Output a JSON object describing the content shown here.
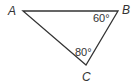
{
  "diagram": {
    "type": "triangle",
    "vertices": [
      {
        "label": "A",
        "x": 23,
        "y": 11
      },
      {
        "label": "B",
        "x": 118,
        "y": 11
      },
      {
        "label": "C",
        "x": 86,
        "y": 65
      }
    ],
    "angles": [
      {
        "vertex": "B",
        "label": "60°"
      },
      {
        "vertex": "C",
        "label": "80°"
      }
    ],
    "line_color": "#333333"
  }
}
